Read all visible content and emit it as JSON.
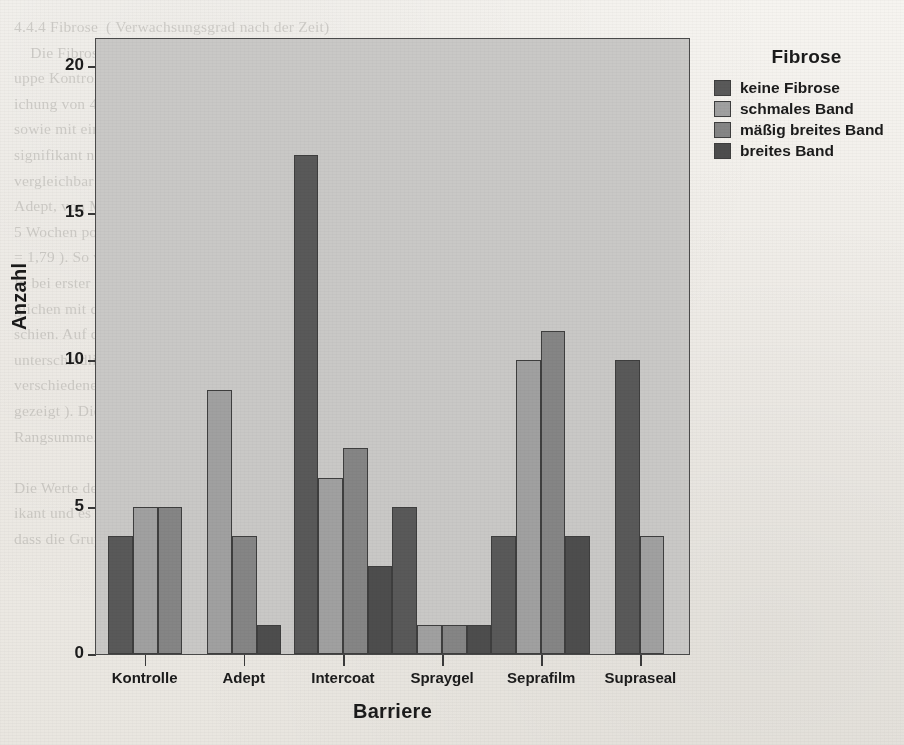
{
  "page": {
    "ghost_text": "4.4.4 Fibrose  ( Verwachsungsgrad nach der Zeit)\n    Die Fibrose wird anhand der Schnitte mit dem Mikroskop  beurteilt. Bei der Gr-\nuppe Kontrolle ergab sich ein mittlerer Rangwert von 9,0 mit einer Standardabwe-\nichung von 4,3. In der Gruppe Adept zeigte sich ein mittlerer Rangwert von 7,1\nsowie mit einer Standardabweichung von 3,6. Die Gruppe Intercoat erreichte einen\nsignifikant niedrigeren Wert ( p < 0,05 ). Die Werte der Gruppe Spraygel sind\nvergleichbar mit denen der Gruppe Seprafilm und Supraseal ( p = 0,21 ).\nAdept, von Mittelwert der Gruppe Adept ( Rang ) 9,0 ; SD 3,7 ; n = 16 ) wird\n5 Wochen postoperativ mit dem Ergebnis der Kontrollgruppe verglichen ( SD\n= 1,79 ). So wird festgestellt, dass die Fibrose bei allen Tieren nachweisbar war.\nIn bei erster und zweiter Messung zeigten sich signifikant niedrigere Werte ver-\nglichen mit denen der Kontrollgruppe, wobei die Schwankung nicht relevant er-\nschien. Auf das Ergebnis der Fibrose wurde nachfolgend eingegangen, um das\nunterschiedliche Verhalten der Barrieren zu beschreiben. Der Vergleich von\nverschiedenen Barrieren zeigt, dass die Unterschiede nicht signifikant sind ( nicht\ngezeigt ). Die Zusammenfassung der Messung erfolgte nach der Tabelle 4.4 als\nRangsumme.\n\nDie Werte der Gruppen im Vergleich zur Kontrollgruppe waren nicht signif-\nikant und es ist kein Unterschied feststellbar ( p = 0,21 ). Es ist nicht zu erkennen,\ndass die Gruppen ( mit 0 ) vergleichbar mit den anderen Gruppen sind, sodass"
  },
  "chart_data": {
    "type": "bar",
    "title": "",
    "xlabel": "Barriere",
    "ylabel": "Anzahl",
    "legend_title": "Fibrose",
    "legend_position": "right",
    "grid": false,
    "ylim": [
      0,
      21
    ],
    "yticks": [
      0,
      5,
      10,
      15,
      20
    ],
    "ytick_labels": [
      "0",
      "5",
      "10",
      "15",
      "20"
    ],
    "categories": [
      "Kontrolle",
      "Adept",
      "Intercoat",
      "Spraygel",
      "Seprafilm",
      "Supraseal"
    ],
    "series": [
      {
        "name": "keine Fibrose",
        "color": "#595959",
        "values": [
          4,
          0,
          17,
          5,
          4,
          10
        ]
      },
      {
        "name": "schmales Band",
        "color": "#a0a0a0",
        "values": [
          5,
          9,
          6,
          1,
          10,
          4
        ]
      },
      {
        "name": "mäßig breites Band",
        "color": "#858585",
        "values": [
          5,
          4,
          7,
          1,
          11,
          0
        ]
      },
      {
        "name": "breites Band",
        "color": "#4d4d4d",
        "values": [
          0,
          1,
          3,
          1,
          4,
          0
        ]
      }
    ],
    "plot_background": "#c9c8c6",
    "axis_color": "#3a3a3a"
  }
}
